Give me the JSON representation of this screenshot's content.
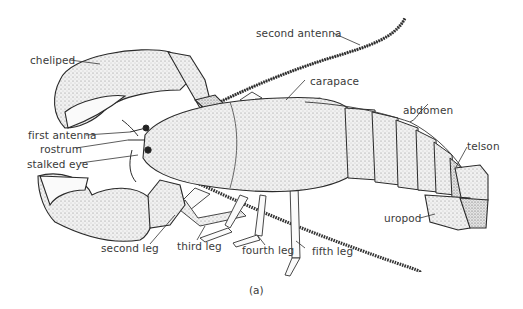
{
  "figure": {
    "caption": "(a)",
    "colors": {
      "ink": "#2a2a2a",
      "label": "#3a3a3a",
      "background": "#ffffff",
      "stipple": "#e6e6e6"
    }
  },
  "labels": {
    "cheliped": "cheliped",
    "second_antenna": "second antenna",
    "carapace": "carapace",
    "abdomen": "abdomen",
    "telson": "telson",
    "first_antenna": "first antenna",
    "rostrum": "rostrum",
    "stalked_eye": "stalked eye",
    "second_leg": "second leg",
    "third_leg": "third leg",
    "fourth_leg": "fourth leg",
    "fifth_leg": "fifth leg",
    "uropod": "uropod"
  }
}
